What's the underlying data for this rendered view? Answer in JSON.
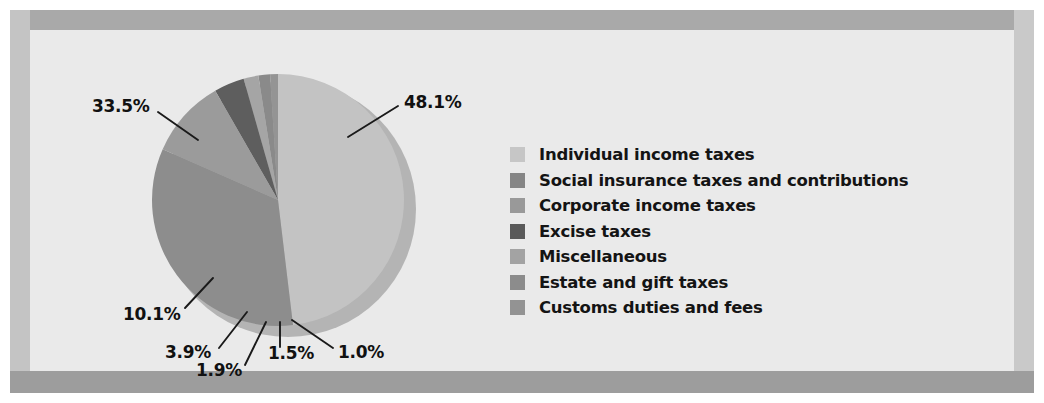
{
  "chart_data": {
    "type": "pie",
    "title": "",
    "categories": [
      "Individual income taxes",
      "Social insurance taxes and contributions",
      "Corporate income taxes",
      "Excise taxes",
      "Miscellaneous",
      "Estate and gift taxes",
      "Customs duties and fees"
    ],
    "values": [
      48.1,
      33.5,
      10.1,
      3.9,
      1.9,
      1.5,
      1.0
    ],
    "value_labels": [
      "48.1%",
      "33.5%",
      "10.1%",
      "3.9%",
      "1.9%",
      "1.5%",
      "1.0%"
    ],
    "unit": "percent",
    "colors": [
      "#c3c3c3",
      "#8d8d8d",
      "#9b9b9b",
      "#5e5e5e",
      "#a5a5a5",
      "#8a8a8a",
      "#949494"
    ],
    "legend_position": "right",
    "grid": false,
    "start_angle_deg": 0,
    "direction": "clockwise"
  },
  "pie": {
    "slices": [
      {
        "label": "Individual income taxes",
        "pct": "48.1%",
        "value": 48.1,
        "color": "#c3c3c3"
      },
      {
        "label": "Social insurance taxes and contributions",
        "pct": "33.5%",
        "value": 33.5,
        "color": "#8d8d8d"
      },
      {
        "label": "Corporate income taxes",
        "pct": "10.1%",
        "value": 10.1,
        "color": "#9b9b9b"
      },
      {
        "label": "Excise taxes",
        "pct": "3.9%",
        "value": 3.9,
        "color": "#5e5e5e"
      },
      {
        "label": "Miscellaneous",
        "pct": "1.9%",
        "value": 1.9,
        "color": "#a5a5a5"
      },
      {
        "label": "Estate and gift taxes",
        "pct": "1.5%",
        "value": 1.5,
        "color": "#8a8a8a"
      },
      {
        "label": "Customs duties and fees",
        "pct": "1.0%",
        "value": 1.0,
        "color": "#949494"
      }
    ]
  },
  "labels": {
    "individual": "48.1%",
    "social": "33.5%",
    "corporate": "10.1%",
    "excise": "3.9%",
    "miscellaneous": "1.9%",
    "estate": "1.5%",
    "customs": "1.0%"
  },
  "legend": {
    "items": [
      {
        "label": "Individual income taxes",
        "color": "#c6c6c6"
      },
      {
        "label": "Social insurance taxes and contributions",
        "color": "#858585"
      },
      {
        "label": "Corporate income taxes",
        "color": "#999999"
      },
      {
        "label": "Excise taxes",
        "color": "#5a5a5a"
      },
      {
        "label": "Miscellaneous",
        "color": "#a3a3a3"
      },
      {
        "label": "Estate and gift taxes",
        "color": "#8c8c8c"
      },
      {
        "label": "Customs duties and fees",
        "color": "#939393"
      }
    ]
  },
  "colors": {
    "plot_background": "#eaeaea",
    "frame": "#b9b9b9",
    "text": "#141414"
  }
}
